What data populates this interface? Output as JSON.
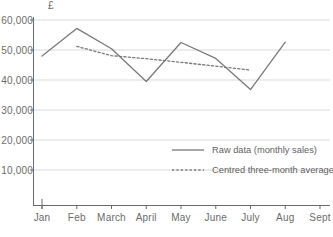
{
  "chart_data": {
    "type": "line",
    "title": "",
    "xlabel": "",
    "ylabel": "£",
    "ylim": [
      0,
      60000
    ],
    "ytick_labels": [
      "60,000",
      "50,000",
      "40,000",
      "30,000",
      "20,000",
      "10,000"
    ],
    "ytick_values": [
      60000,
      50000,
      40000,
      30000,
      20000,
      10000
    ],
    "categories": [
      "Jan",
      "Feb",
      "March",
      "April",
      "May",
      "June",
      "July",
      "Aug",
      "Sept"
    ],
    "grid": true,
    "legend_position": "center-right",
    "series": [
      {
        "name": "Raw data (monthly sales)",
        "style": "solid",
        "color": "#7a7a7a",
        "x": [
          "Jan",
          "Feb",
          "March",
          "April",
          "May",
          "June",
          "July",
          "Aug"
        ],
        "values": [
          48000,
          57200,
          50400,
          39500,
          52500,
          47200,
          36800,
          52600
        ]
      },
      {
        "name": "Centred three-month average",
        "style": "dotted",
        "color": "#7a7a7a",
        "x": [
          "Feb",
          "March",
          "April",
          "May",
          "June",
          "July"
        ],
        "values": [
          51200,
          48100,
          47100,
          45900,
          44600,
          43300
        ]
      }
    ]
  },
  "axis": {
    "unit_label": "£"
  },
  "legend": {
    "items": [
      {
        "label": "Raw data (monthly sales)",
        "style": "solid"
      },
      {
        "label": "Centred three-month average",
        "style": "dotted"
      }
    ]
  },
  "colors": {
    "line": "#7a7a7a",
    "grid": "#d9d9d9",
    "axis": "#6b6b6b",
    "text": "#6b6b6b",
    "background": "#ffffff"
  }
}
